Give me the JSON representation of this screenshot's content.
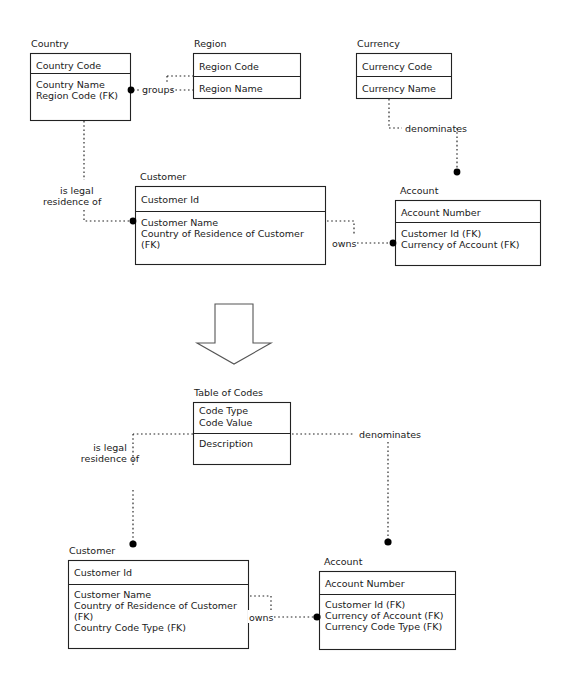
{
  "figure": {
    "kind": "entity-relationship-diagram",
    "colors": {
      "background": "#ffffff",
      "line": "#222222",
      "text": "#1a1a1a",
      "dot": "#000000",
      "arrow_stroke": "#555555",
      "arrow_fill": "#ffffff"
    }
  },
  "top_model": {
    "entities": [
      {
        "id": "country",
        "title": "Country",
        "key_attributes": [
          "Country Code"
        ],
        "attributes": [
          "Country Name",
          "Region Code (FK)"
        ]
      },
      {
        "id": "region",
        "title": "Region",
        "key_attributes": [
          "Region Code"
        ],
        "attributes": [
          "Region Name"
        ]
      },
      {
        "id": "currency",
        "title": "Currency",
        "key_attributes": [
          "Currency Code"
        ],
        "attributes": [
          "Currency Name"
        ]
      },
      {
        "id": "customer",
        "title": "Customer",
        "key_attributes": [
          "Customer Id"
        ],
        "attributes": [
          "Customer Name",
          "Country of Residence of Customer",
          "(FK)"
        ]
      },
      {
        "id": "account",
        "title": "Account",
        "key_attributes": [
          "Account Number"
        ],
        "attributes": [
          "Customer Id (FK)",
          "Currency of Account (FK)"
        ]
      }
    ],
    "relationships": [
      {
        "id": "groups",
        "label": "groups",
        "from": "region",
        "to": "country"
      },
      {
        "id": "denominates",
        "label": "denominates",
        "from": "currency",
        "to": "account"
      },
      {
        "id": "is-legal-residence-of",
        "label_line1": "is legal",
        "label_line2": "residence of",
        "from": "country",
        "to": "customer"
      },
      {
        "id": "owns",
        "label": "owns",
        "from": "customer",
        "to": "account"
      }
    ]
  },
  "transform_arrow": {
    "name": "downward-transformation-arrow",
    "direction": "down"
  },
  "bottom_model": {
    "entities": [
      {
        "id": "table-of-codes",
        "title": "Table of Codes",
        "key_attributes": [
          "Code Type",
          "Code Value"
        ],
        "attributes": [
          "Description"
        ]
      },
      {
        "id": "customer",
        "title": "Customer",
        "key_attributes": [
          "Customer Id"
        ],
        "attributes": [
          "Customer Name",
          "Country of Residence of Customer",
          "(FK)",
          "Country Code Type (FK)"
        ]
      },
      {
        "id": "account",
        "title": "Account",
        "key_attributes": [
          "Account Number"
        ],
        "attributes": [
          "Customer Id (FK)",
          "Currency of Account (FK)",
          "Currency Code Type (FK)"
        ]
      }
    ],
    "relationships": [
      {
        "id": "is-legal-residence-of",
        "label_line1": "is legal",
        "label_line2": "residence of",
        "from": "table-of-codes",
        "to": "customer"
      },
      {
        "id": "denominates",
        "label": "denominates",
        "from": "table-of-codes",
        "to": "account"
      },
      {
        "id": "owns",
        "label": "owns",
        "from": "customer",
        "to": "account"
      }
    ]
  }
}
